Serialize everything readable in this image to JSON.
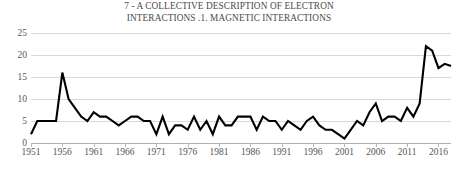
{
  "chart_data": {
    "type": "line",
    "title": "7 - A COLLECTIVE DESCRIPTION OF ELECTRON\nINTERACTIONS .1. MAGNETIC INTERACTIONS",
    "xlabel": "",
    "ylabel": "",
    "ylim": [
      0,
      25
    ],
    "xlim": [
      1951,
      2018
    ],
    "yticks": [
      0,
      5,
      10,
      15,
      20,
      25
    ],
    "ytick_labels": [
      "0",
      "5",
      "10",
      "15",
      "20",
      "25"
    ],
    "xticks": [
      1951,
      1956,
      1961,
      1966,
      1971,
      1976,
      1981,
      1986,
      1991,
      1996,
      2001,
      2006,
      2011,
      2016
    ],
    "xtick_labels": [
      "1951",
      "1956",
      "1961",
      "1966",
      "1971",
      "1976",
      "1981",
      "1986",
      "1991",
      "1996",
      "2001",
      "2006",
      "2011",
      "2016"
    ],
    "grid": true,
    "legend": false,
    "legend_position": "none",
    "line_color": "#000000",
    "line_width": 2.1,
    "grid_color": "#d9d9d9",
    "background_color": "#ffffff",
    "x": [
      1951,
      1952,
      1953,
      1954,
      1955,
      1956,
      1957,
      1958,
      1959,
      1960,
      1961,
      1962,
      1963,
      1964,
      1965,
      1966,
      1967,
      1968,
      1969,
      1970,
      1971,
      1972,
      1973,
      1974,
      1975,
      1976,
      1977,
      1978,
      1979,
      1980,
      1981,
      1982,
      1983,
      1984,
      1985,
      1986,
      1987,
      1988,
      1989,
      1990,
      1991,
      1992,
      1993,
      1994,
      1995,
      1996,
      1997,
      1998,
      1999,
      2000,
      2001,
      2002,
      2003,
      2004,
      2005,
      2006,
      2007,
      2008,
      2009,
      2010,
      2011,
      2012,
      2013,
      2014,
      2015,
      2016,
      2017,
      2018
    ],
    "values": [
      2,
      5,
      5,
      5,
      5,
      16,
      10,
      8,
      6,
      5,
      7,
      6,
      6,
      5,
      4,
      5,
      6,
      6,
      5,
      5,
      2,
      6,
      2,
      4,
      4,
      3,
      6,
      3,
      5,
      2,
      6,
      4,
      4,
      6,
      6,
      6,
      3,
      6,
      5,
      5,
      3,
      5,
      4,
      3,
      5,
      6,
      4,
      3,
      3,
      2,
      1,
      3,
      5,
      4,
      7,
      9,
      5,
      6,
      6,
      5,
      8,
      6,
      9,
      22,
      21,
      17,
      18,
      17.5
    ],
    "series": [
      {
        "name": "publications",
        "values": [
          2,
          5,
          5,
          5,
          5,
          16,
          10,
          8,
          6,
          5,
          7,
          6,
          6,
          5,
          4,
          5,
          6,
          6,
          5,
          5,
          2,
          6,
          2,
          4,
          4,
          3,
          6,
          3,
          5,
          2,
          6,
          4,
          4,
          6,
          6,
          6,
          3,
          6,
          5,
          5,
          3,
          5,
          4,
          3,
          5,
          6,
          4,
          3,
          3,
          2,
          1,
          3,
          5,
          4,
          7,
          9,
          5,
          6,
          6,
          5,
          8,
          6,
          9,
          22,
          21,
          17,
          18,
          17.5
        ]
      }
    ],
    "annotations": []
  }
}
